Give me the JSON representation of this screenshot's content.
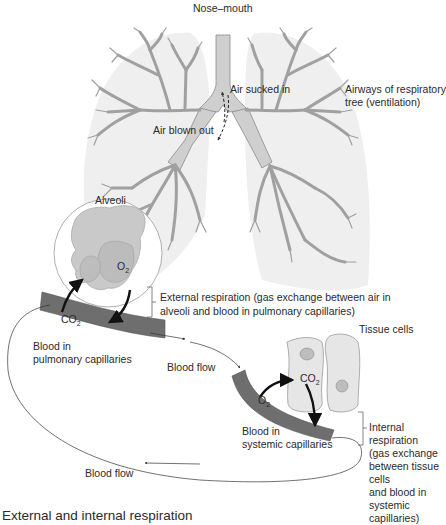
{
  "diagram": {
    "title": "External and internal respiration",
    "labels": {
      "nose_mouth": "Nose–mouth",
      "air_sucked_in": "Air sucked in",
      "air_blown_out": "Air blown out",
      "airways_line1": "Airways of respiratory",
      "airways_line2": "tree (ventilation)",
      "alveoli": "Alveoli",
      "o2_alveoli": "O",
      "co2_pulmonary": "CO",
      "external_line1": "External respiration (gas exchange between air in",
      "external_line2": "alveoli and blood in pulmonary capillaries)",
      "blood_pulmonary_line1": "Blood in",
      "blood_pulmonary_line2": "pulmonary capillaries",
      "blood_flow_top": "Blood flow",
      "tissue_cells": "Tissue cells",
      "co2_tissue": "CO",
      "o2_systemic": "O",
      "blood_systemic_line1": "Blood in",
      "blood_systemic_line2": "systemic capillaries",
      "internal_lines": [
        "Internal",
        "respiration",
        "(gas exchange",
        "between tissue",
        "cells",
        "and blood in",
        "systemic",
        "capillaries)"
      ],
      "blood_flow_bottom": "Blood flow",
      "subscript_2": "2"
    },
    "colors": {
      "lung_fill": "#efefef",
      "airway_fill": "#cfcfcf",
      "airway_stroke": "#8a8a8a",
      "capillary_fill": "#6e6e6e",
      "alveoli_fill": "#c9c9c9",
      "cell_fill": "#e6e6e6",
      "arrow": "#111111"
    }
  }
}
